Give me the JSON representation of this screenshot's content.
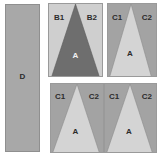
{
  "figure": {
    "background_color": "#ffffff"
  },
  "colors": {
    "rect_fill": "#a8a8a8",
    "panel_light_fill": "#cfcfcf",
    "panel_medium_fill": "#a3a3a3",
    "triangle_dark_fill": "#6e6e6e",
    "triangle_light_fill": "#d4d4d4",
    "outline": "#8f8f8f",
    "label_dark": "#2b2b2b",
    "label_light": "#f2f2f2"
  },
  "panels": {
    "d": {
      "name": "rectangle-panel-d",
      "label": "D",
      "fill": "#a8a8a8",
      "shape": "rectangle"
    },
    "b": {
      "name": "triangle-panel-b",
      "background_fill": "#cfcfcf",
      "triangle_fill": "#6e6e6e",
      "triangle_label": "A",
      "left_label": "B1",
      "right_label": "B2",
      "shape": "triangle-in-rectangle"
    },
    "c_top": {
      "name": "triangle-panel-c-top-right",
      "background_fill": "#a3a3a3",
      "triangle_fill": "#d4d4d4",
      "triangle_label": "A",
      "left_label": "C1",
      "right_label": "C2",
      "shape": "triangle-in-rectangle"
    },
    "c_bottom_left": {
      "name": "triangle-panel-c-bottom-left",
      "background_fill": "#a3a3a3",
      "triangle_fill": "#d4d4d4",
      "triangle_label": "A",
      "left_label": "C1",
      "right_label": "C2",
      "shape": "triangle-in-rectangle"
    },
    "c_bottom_right": {
      "name": "triangle-panel-c-bottom-right",
      "background_fill": "#a3a3a3",
      "triangle_fill": "#d4d4d4",
      "triangle_label": "A",
      "left_label": "C1",
      "right_label": "C2",
      "shape": "triangle-in-rectangle"
    }
  }
}
